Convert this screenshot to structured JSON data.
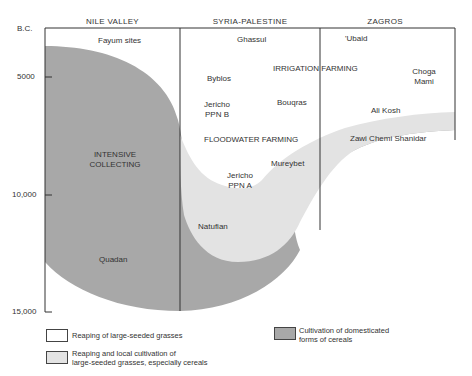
{
  "headers": [
    "NILE VALLEY",
    "SYRIA-PALESTINE",
    "ZAGROS"
  ],
  "axis": {
    "unit_label": "B.C.",
    "ticks": [
      "5000",
      "10,000",
      "15,000"
    ]
  },
  "regions": {
    "intensive_collecting": "INTENSIVE\nCOLLECTING",
    "floodwater_farming": "FLOODWATER FARMING",
    "irrigation_farming": "IRRIGATION FARMING"
  },
  "sites": {
    "fayum": "Fayum sites",
    "ghassul": "Ghassul",
    "ubaid": "'Ubaid",
    "byblos": "Byblos",
    "choga_mami": "Choga\nMami",
    "jericho_ppnb": "Jericho\nPPN B",
    "bouqras": "Bouqras",
    "ali_kosh": "Ali Kosh",
    "zawi_chemi": "Zawi Chemi Shanidar",
    "mureybet": "Mureybet",
    "jericho_ppna": "Jericho\nPPN A",
    "natufian": "Natufian",
    "quadan": "Quadan"
  },
  "legend": [
    {
      "label": "Reaping of large-seeded grasses",
      "color": "#ffffff"
    },
    {
      "label": "Reaping and local cultivation of\nlarge-seeded grasses, especially cereals",
      "color": "#e3e3e3"
    },
    {
      "label": "Cultivation of domesticated\nforms of cereals",
      "color": "#a8a8a8"
    }
  ],
  "colors": {
    "domesticated": "#a8a8a8",
    "local_cultivation": "#e3e3e3",
    "reaping": "#ffffff",
    "line": "#333333"
  }
}
